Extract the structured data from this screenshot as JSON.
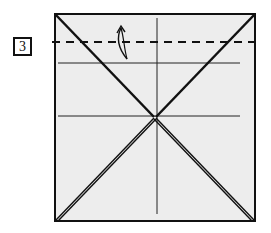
{
  "step": {
    "number": "3"
  },
  "diagram": {
    "type": "origami-fold-step",
    "paper_color": "#ededed",
    "line_color": "#111111",
    "square": {
      "x": 54,
      "y": 13,
      "width": 202,
      "height": 209
    },
    "valley_fold_line": {
      "y": 42,
      "style": "dashed"
    },
    "existing_creases": {
      "horizontal_upper_y": 63,
      "horizontal_middle_y": 116,
      "vertical_center_x": 157
    },
    "diagonals": "both corner-to-corner with doubled layers",
    "arrow": {
      "direction": "up",
      "meaning": "fold edge up along dashed line"
    }
  }
}
